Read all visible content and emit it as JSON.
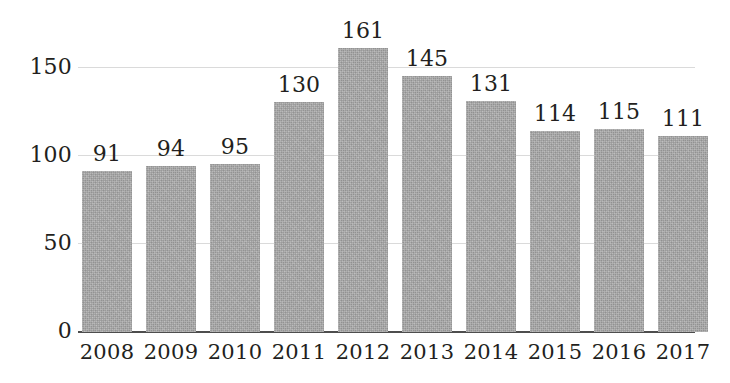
{
  "chart_data": {
    "type": "bar",
    "title": "",
    "subtitle": "",
    "xlabel": "",
    "ylabel": "",
    "categories": [
      "2008",
      "2009",
      "2010",
      "2011",
      "2012",
      "2013",
      "2014",
      "2015",
      "2016",
      "2017"
    ],
    "values": [
      91,
      94,
      95,
      130,
      161,
      145,
      131,
      114,
      115,
      111
    ],
    "data_labels": [
      "91",
      "94",
      "95",
      "130",
      "161",
      "145",
      "131",
      "114",
      "115",
      "111"
    ],
    "ylim": [
      0,
      170
    ],
    "yticks": [
      0,
      50,
      100,
      150
    ],
    "ytick_labels": [
      "0",
      "50",
      "100",
      "150"
    ],
    "grid": true,
    "grid_axis": "y",
    "legend": false,
    "legend_position": "none",
    "series": [
      {
        "name": "",
        "values": [
          91,
          94,
          95,
          130,
          161,
          145,
          131,
          114,
          115,
          111
        ]
      }
    ]
  },
  "style": {
    "background": "#ffffff",
    "bar_color": "#ababab",
    "gridline_color": "#dadada",
    "axis_color": "#4d4d4d",
    "text_color": "#231f20"
  }
}
